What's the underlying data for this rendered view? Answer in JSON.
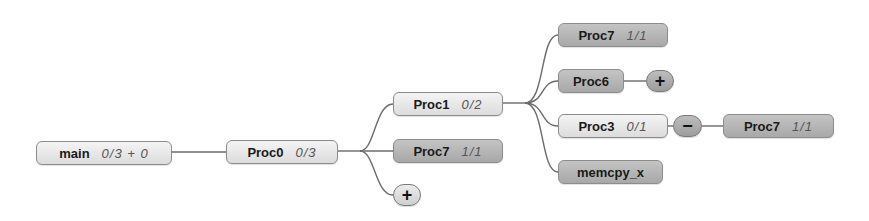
{
  "diagram": {
    "type": "call-tree",
    "nodes": {
      "main": {
        "name": "main",
        "count": "0/3 + 0"
      },
      "proc0": {
        "name": "Proc0",
        "count": "0/3"
      },
      "proc1": {
        "name": "Proc1",
        "count": "0/2"
      },
      "proc7a": {
        "name": "Proc7",
        "count": "1/1"
      },
      "proc7b": {
        "name": "Proc7",
        "count": "1/1"
      },
      "proc6": {
        "name": "Proc6",
        "count": ""
      },
      "proc3": {
        "name": "Proc3",
        "count": "0/1"
      },
      "proc7c": {
        "name": "Proc7",
        "count": "1/1"
      },
      "memcpy": {
        "name": "memcpy_x",
        "count": ""
      }
    },
    "toggles": {
      "proc0_expand": {
        "symbol": "+"
      },
      "proc6_expand": {
        "symbol": "+"
      },
      "proc3_collapse": {
        "symbol": "−"
      }
    },
    "edges": [
      [
        "main",
        "proc0"
      ],
      [
        "proc0",
        "proc1"
      ],
      [
        "proc0",
        "proc7a"
      ],
      [
        "proc0",
        "proc0_expand"
      ],
      [
        "proc1",
        "proc7b"
      ],
      [
        "proc1",
        "proc6"
      ],
      [
        "proc1",
        "proc3"
      ],
      [
        "proc1",
        "memcpy"
      ],
      [
        "proc6",
        "proc6_expand"
      ],
      [
        "proc3",
        "proc3_collapse"
      ],
      [
        "proc3_collapse",
        "proc7c"
      ]
    ],
    "colors": {
      "node_light": "#e8e8e8",
      "node_dark": "#b6b6b6",
      "edge": "#6b6b6b",
      "border": "#8c8c8c"
    }
  }
}
